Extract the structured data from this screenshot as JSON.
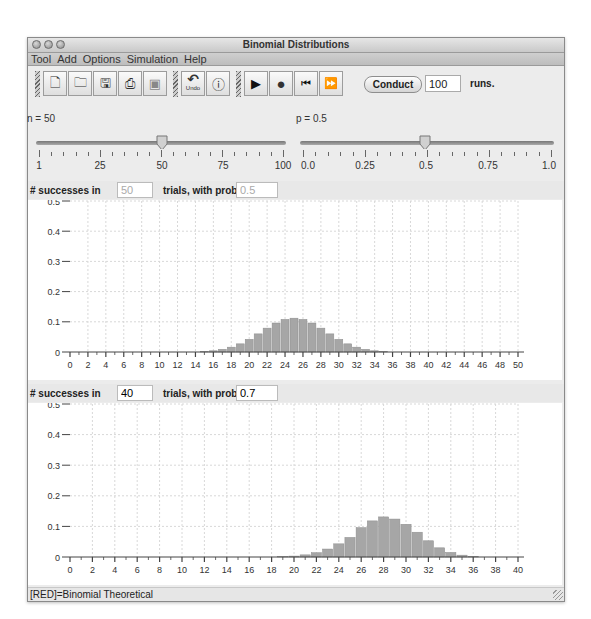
{
  "window": {
    "title": "Binomial Distributions",
    "traffic_lights": [
      "close",
      "minimize",
      "zoom"
    ]
  },
  "menubar": {
    "items": [
      "Tool",
      "Add",
      "Options",
      "Simulation",
      "Help"
    ]
  },
  "toolbar": {
    "file_buttons": [
      {
        "name": "new-document-icon",
        "glyph": "🗋"
      },
      {
        "name": "open-folder-icon",
        "glyph": "🗀"
      },
      {
        "name": "save-icon",
        "glyph": "🖫"
      },
      {
        "name": "print-icon",
        "glyph": "⎙"
      },
      {
        "name": "picture-icon",
        "glyph": "▣"
      }
    ],
    "edit_buttons": [
      {
        "name": "undo-icon",
        "glyph": "↶",
        "label": "Undo"
      },
      {
        "name": "info-balloon-icon",
        "glyph": "ⓘ"
      }
    ],
    "sim_buttons": [
      {
        "name": "play-icon",
        "glyph": "▶"
      },
      {
        "name": "stop-icon",
        "glyph": "●"
      },
      {
        "name": "rewind-icon",
        "glyph": "⏮"
      },
      {
        "name": "fast-forward-icon",
        "glyph": "⏩"
      }
    ],
    "conduct_label": "Conduct",
    "runs_value": "100",
    "runs_label": "runs."
  },
  "sliders": {
    "n": {
      "label": "n = 50",
      "value": 50,
      "min": 1,
      "max": 100,
      "tick_labels": [
        "1",
        "25",
        "50",
        "75",
        "100"
      ]
    },
    "p": {
      "label": "p = 0.5",
      "value": 0.5,
      "min": 0.0,
      "max": 1.0,
      "tick_labels": [
        "0.0",
        "0.25",
        "0.5",
        "0.75",
        "1.0"
      ]
    }
  },
  "panel1": {
    "prefix": "# successes in",
    "trials": "50",
    "middle": "trials, with prob.",
    "prob": "0.5",
    "inputs_disabled": true
  },
  "panel2": {
    "prefix": "# successes in",
    "trials": "40",
    "middle": "trials, with prob.",
    "prob": "0.7",
    "inputs_disabled": false
  },
  "status": {
    "text": "[RED]=Binomial Theoretical"
  },
  "colors": {
    "bar": "#a6a6a6",
    "grid": "#d8d8d8",
    "axis": "#444444"
  },
  "chart_data": [
    {
      "type": "bar",
      "title": "# successes in 50 trials, with prob. 0.5",
      "xlabel": "",
      "ylabel": "",
      "xlim": [
        0,
        50
      ],
      "ylim": [
        0,
        0.5
      ],
      "x_tick_labels": [
        "0",
        "2",
        "4",
        "6",
        "8",
        "10",
        "12",
        "14",
        "16",
        "18",
        "20",
        "22",
        "24",
        "26",
        "28",
        "30",
        "32",
        "34",
        "36",
        "38",
        "40",
        "42",
        "44",
        "46",
        "48",
        "50"
      ],
      "y_tick_labels": [
        "0",
        "0.1",
        "0.2",
        "0.3",
        "0.4",
        "0.5"
      ],
      "grid": true,
      "x": [
        15,
        16,
        17,
        18,
        19,
        20,
        21,
        22,
        23,
        24,
        25,
        26,
        27,
        28,
        29,
        30,
        31,
        32,
        33,
        34,
        35
      ],
      "values": [
        0.002,
        0.004,
        0.009,
        0.016,
        0.027,
        0.042,
        0.06,
        0.079,
        0.096,
        0.108,
        0.112,
        0.108,
        0.096,
        0.079,
        0.06,
        0.042,
        0.027,
        0.016,
        0.009,
        0.004,
        0.002
      ]
    },
    {
      "type": "bar",
      "title": "# successes in 40 trials, with prob. 0.7",
      "xlabel": "",
      "ylabel": "",
      "xlim": [
        0,
        40
      ],
      "ylim": [
        0,
        0.5
      ],
      "x_tick_labels": [
        "0",
        "2",
        "4",
        "6",
        "8",
        "10",
        "12",
        "14",
        "16",
        "18",
        "20",
        "22",
        "24",
        "26",
        "28",
        "30",
        "32",
        "34",
        "36",
        "38",
        "40"
      ],
      "y_tick_labels": [
        "0",
        "0.1",
        "0.2",
        "0.3",
        "0.4",
        "0.5"
      ],
      "grid": true,
      "x": [
        19,
        20,
        21,
        22,
        23,
        24,
        25,
        26,
        27,
        28,
        29,
        30,
        31,
        32,
        33,
        34,
        35,
        36
      ],
      "values": [
        0.001,
        0.003,
        0.007,
        0.014,
        0.026,
        0.043,
        0.064,
        0.096,
        0.118,
        0.131,
        0.124,
        0.107,
        0.081,
        0.053,
        0.03,
        0.015,
        0.006,
        0.002
      ]
    }
  ]
}
